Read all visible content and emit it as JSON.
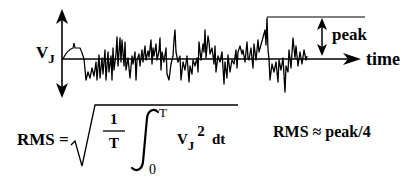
{
  "diagram": {
    "axis": {
      "y_label": "V",
      "y_label_sub": "J",
      "x_label": "time"
    },
    "peak_label": "peak",
    "formula": {
      "lhs": "RMS =",
      "numerator": "1",
      "denominator": "T",
      "upper_limit": "T",
      "lower_limit": "0",
      "integrand_base": "V",
      "integrand_sub": "J",
      "integrand_exp": "2",
      "differential": "dt"
    },
    "approximation": "RMS ≈ peak/4",
    "colors": {
      "ink": "#000000",
      "background": "#ffffff"
    }
  }
}
